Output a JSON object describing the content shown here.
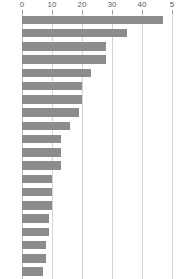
{
  "chart_data": {
    "type": "bar",
    "orientation": "horizontal",
    "title": "",
    "subtitle": "",
    "xlabel": "",
    "ylabel": "",
    "xlim": [
      0,
      50
    ],
    "ylim": null,
    "grid": true,
    "grid_axis": "x",
    "legend": false,
    "legend_position": "none",
    "bar_color": "#8c8c8c",
    "gridline_color": "#d4d4d4",
    "tick_label_color": "#5b5b5b",
    "background": "#ffffff",
    "axis_ticks": [
      0,
      10,
      20,
      30,
      40,
      50
    ],
    "axis_tick_labels": [
      "0",
      "10",
      "20",
      "30",
      "40",
      "5"
    ],
    "categories": [
      "",
      "",
      "",
      "",
      "",
      "",
      "",
      "",
      "",
      "",
      "",
      "",
      "",
      "",
      "",
      "",
      "",
      "",
      "",
      ""
    ],
    "values": [
      47,
      35,
      28,
      28,
      23,
      20,
      20,
      19,
      16,
      13,
      13,
      13,
      10,
      10,
      10,
      9,
      9,
      8,
      8,
      7
    ],
    "bar_count": 20,
    "sorted": "descending"
  },
  "axis": {
    "ticks": [
      {
        "value": 0,
        "label": "0"
      },
      {
        "value": 10,
        "label": "10"
      },
      {
        "value": 20,
        "label": "20"
      },
      {
        "value": 30,
        "label": "30"
      },
      {
        "value": 40,
        "label": "40"
      },
      {
        "value": 50,
        "label": "5"
      }
    ]
  },
  "geometry": {
    "origin_x": 22,
    "px_per_unit": 3.0,
    "plot_top": 14,
    "plot_height": 265,
    "bar_pitch": 13.25,
    "bar_thickness": 8.6
  }
}
